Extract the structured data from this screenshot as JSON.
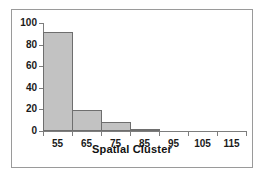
{
  "chart_data": {
    "type": "bar",
    "title": "",
    "subtitle": "",
    "xlabel": "Spatial Cluster",
    "ylabel": "",
    "categories": [
      "55",
      "65",
      "75",
      "85",
      "95",
      "105",
      "115"
    ],
    "values": [
      92,
      19,
      8,
      2,
      0,
      0,
      0
    ],
    "x_tick_labels": [
      "55",
      "65",
      "75",
      "85",
      "95",
      "105",
      "115"
    ],
    "y_tick_labels": [
      "0",
      "20",
      "40",
      "60",
      "80",
      "100"
    ],
    "y_ticks": [
      0,
      20,
      40,
      60,
      80,
      100
    ],
    "ylim": [
      0,
      100
    ],
    "xlim": [
      50,
      120
    ],
    "bin_width": 10,
    "grid": false,
    "legend": false,
    "legend_position": "none",
    "series": [
      {
        "name": "Frequency",
        "values": [
          92,
          19,
          8,
          2,
          0,
          0,
          0
        ]
      }
    ],
    "bars": [
      {
        "label": "55",
        "value": 92,
        "bin_start": 50,
        "bin_end": 60
      },
      {
        "label": "65",
        "value": 19,
        "bin_start": 60,
        "bin_end": 70
      },
      {
        "label": "75",
        "value": 8,
        "bin_start": 70,
        "bin_end": 80
      },
      {
        "label": "85",
        "value": 2,
        "bin_start": 80,
        "bin_end": 90
      },
      {
        "label": "95",
        "value": 0,
        "bin_start": 90,
        "bin_end": 100
      },
      {
        "label": "105",
        "value": 0,
        "bin_start": 100,
        "bin_end": 110
      },
      {
        "label": "115",
        "value": 0,
        "bin_start": 110,
        "bin_end": 120
      }
    ],
    "colors": {
      "bar_fill": "#c2c2c2",
      "bar_edge": "#6e6e6e",
      "axis": "#7d7d7d",
      "text": "#111111",
      "frame": "#9a9a9a",
      "background": "#ffffff"
    }
  }
}
